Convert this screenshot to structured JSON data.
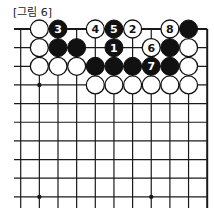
{
  "title": "[그림 6]",
  "board": {
    "origin_x": 20.7,
    "origin_y": 29,
    "spacing": 18.65,
    "columns": 11,
    "rows": 10,
    "line_left_x": 14,
    "line_bottom_y": 208,
    "top_edge": true,
    "right_edge": true,
    "stone_radius": 9,
    "star_points": [
      {
        "col": 2,
        "row": 4
      },
      {
        "col": 2,
        "row": 10
      },
      {
        "col": 8,
        "row": 10
      }
    ],
    "stones": [
      {
        "col": 2,
        "row": 1,
        "color": "white",
        "label": ""
      },
      {
        "col": 3,
        "row": 1,
        "color": "black",
        "label": "3"
      },
      {
        "col": 5,
        "row": 1,
        "color": "white",
        "label": "4"
      },
      {
        "col": 6,
        "row": 1,
        "color": "black",
        "label": "5"
      },
      {
        "col": 7,
        "row": 1,
        "color": "white",
        "label": "2"
      },
      {
        "col": 9,
        "row": 1,
        "color": "white",
        "label": "8"
      },
      {
        "col": 10,
        "row": 1,
        "color": "black",
        "label": ""
      },
      {
        "col": 2,
        "row": 2,
        "color": "white",
        "label": ""
      },
      {
        "col": 3,
        "row": 2,
        "color": "black",
        "label": ""
      },
      {
        "col": 4,
        "row": 2,
        "color": "black",
        "label": ""
      },
      {
        "col": 6,
        "row": 2,
        "color": "black",
        "label": "1"
      },
      {
        "col": 8,
        "row": 2,
        "color": "white",
        "label": "6"
      },
      {
        "col": 9,
        "row": 2,
        "color": "black",
        "label": ""
      },
      {
        "col": 10,
        "row": 2,
        "color": "white",
        "label": ""
      },
      {
        "col": 2,
        "row": 3,
        "color": "white",
        "label": ""
      },
      {
        "col": 3,
        "row": 3,
        "color": "white",
        "label": ""
      },
      {
        "col": 4,
        "row": 3,
        "color": "white",
        "label": ""
      },
      {
        "col": 5,
        "row": 3,
        "color": "black",
        "label": ""
      },
      {
        "col": 6,
        "row": 3,
        "color": "black",
        "label": ""
      },
      {
        "col": 7,
        "row": 3,
        "color": "black",
        "label": ""
      },
      {
        "col": 8,
        "row": 3,
        "color": "black",
        "label": "7"
      },
      {
        "col": 9,
        "row": 3,
        "color": "black",
        "label": ""
      },
      {
        "col": 10,
        "row": 3,
        "color": "white",
        "label": ""
      },
      {
        "col": 5,
        "row": 4,
        "color": "white",
        "label": ""
      },
      {
        "col": 6,
        "row": 4,
        "color": "white",
        "label": ""
      },
      {
        "col": 7,
        "row": 4,
        "color": "white",
        "label": ""
      },
      {
        "col": 8,
        "row": 4,
        "color": "white",
        "label": ""
      },
      {
        "col": 9,
        "row": 4,
        "color": "white",
        "label": ""
      },
      {
        "col": 10,
        "row": 4,
        "color": "white",
        "label": ""
      }
    ]
  },
  "colors": {
    "line": "#1a1a1a",
    "black_stone": "#111111",
    "white_stone": "#ffffff",
    "background": "#ffffff"
  }
}
